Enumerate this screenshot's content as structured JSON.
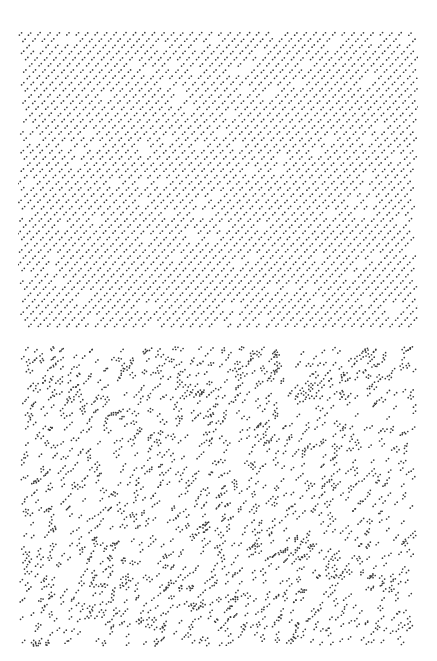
{
  "figure": {
    "panels": [
      {
        "id": "top",
        "pattern": "regular-diagonal-dot-pairs",
        "x": 18,
        "y": 30,
        "width": 400,
        "height": 300,
        "spacing_x": 9.5,
        "spacing_y": 6.2,
        "row_shift": 3.6,
        "pair_dx": 2.2,
        "pair_dy": -2.2,
        "dot_radius": 0.85,
        "jitter": 0.5,
        "dropout": 0.06,
        "warp_amplitude": 2.5,
        "color": "#3a3a3a",
        "seed": 7
      },
      {
        "id": "bottom",
        "pattern": "random-dot-pairs",
        "x": 18,
        "y": 345,
        "width": 400,
        "height": 303,
        "count": 1650,
        "pair_dx": 2.2,
        "pair_dy": -2.2,
        "dot_radius": 0.85,
        "color": "#3a3a3a",
        "seed": 23
      }
    ]
  }
}
